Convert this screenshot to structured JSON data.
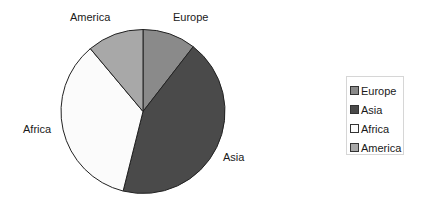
{
  "chart_data": {
    "type": "pie",
    "title": "",
    "categories": [
      "Europe",
      "Asia",
      "Africa",
      "America"
    ],
    "values": [
      10.5,
      43.4,
      35.0,
      11.1
    ],
    "unit": "percent (estimated from slice angles)",
    "start_angle_deg": 0,
    "direction": "clockwise",
    "colors": [
      "#8a8a8a",
      "#4a4a4a",
      "#fbfbfb",
      "#a8a8a8"
    ],
    "slice_border_color": "#222222",
    "legend": {
      "position": "right",
      "entries": [
        "Europe",
        "Asia",
        "Africa",
        "America"
      ]
    },
    "data_labels": [
      "Europe",
      "Asia",
      "Africa",
      "America"
    ]
  },
  "pie": {
    "cx": 143,
    "cy": 111.5,
    "r": 82
  },
  "labels": {
    "europe": "Europe",
    "asia": "Asia",
    "africa": "Africa",
    "america": "America"
  },
  "legend": {
    "items": [
      {
        "label": "Europe",
        "color": "#8a8a8a"
      },
      {
        "label": "Asia",
        "color": "#4a4a4a"
      },
      {
        "label": "Africa",
        "color": "#fbfbfb"
      },
      {
        "label": "America",
        "color": "#a8a8a8"
      }
    ]
  }
}
